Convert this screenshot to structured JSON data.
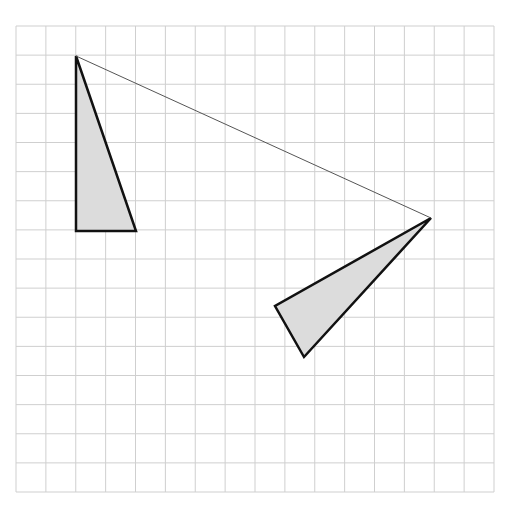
{
  "diagram": {
    "type": "geometry-grid-rotation",
    "background_color": "#ffffff",
    "grid": {
      "columns": 16,
      "rows": 16,
      "left": 16,
      "top": 26,
      "right": 494,
      "bottom": 492,
      "line_color": "#cfcfcf"
    },
    "shapes": [
      {
        "name": "original-triangle",
        "kind": "triangle",
        "points_px": [
          [
            76,
            56
          ],
          [
            76,
            231
          ],
          [
            136,
            231
          ]
        ],
        "fill": "#dcdcdc",
        "stroke": "#111111",
        "stroke_width": 2.5
      },
      {
        "name": "rotated-triangle",
        "kind": "triangle",
        "points_px": [
          [
            431,
            218
          ],
          [
            275,
            306
          ],
          [
            304,
            357
          ]
        ],
        "fill": "#dcdcdc",
        "stroke": "#111111",
        "stroke_width": 2.5
      }
    ],
    "connectors": [
      {
        "name": "rotation-segment",
        "from_px": [
          76,
          56
        ],
        "to_px": [
          431,
          218
        ],
        "stroke": "#555555",
        "stroke_width": 1
      }
    ]
  }
}
